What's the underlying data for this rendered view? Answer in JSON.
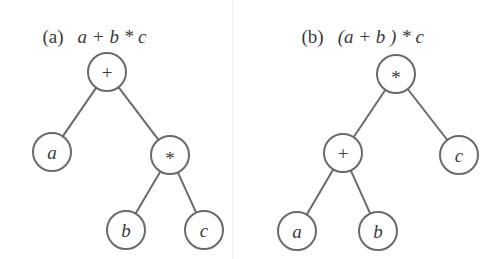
{
  "figure": {
    "panel_a": {
      "tag": "(a)",
      "expression": "a + b * c",
      "nodes": [
        {
          "id": "a_plus",
          "label": "+",
          "x": 107,
          "y": 72,
          "kind": "op"
        },
        {
          "id": "a_a",
          "label": "a",
          "x": 52,
          "y": 152,
          "kind": "var"
        },
        {
          "id": "a_mul",
          "label": "*",
          "x": 170,
          "y": 155,
          "kind": "op"
        },
        {
          "id": "a_b",
          "label": "b",
          "x": 126,
          "y": 230,
          "kind": "var"
        },
        {
          "id": "a_c",
          "label": "c",
          "x": 204,
          "y": 230,
          "kind": "var"
        }
      ],
      "edges": [
        [
          "a_plus",
          "a_a"
        ],
        [
          "a_plus",
          "a_mul"
        ],
        [
          "a_mul",
          "a_b"
        ],
        [
          "a_mul",
          "a_c"
        ]
      ]
    },
    "panel_b": {
      "tag": "(b)",
      "expression": "(a + b ) * c",
      "nodes": [
        {
          "id": "b_mul",
          "label": "*",
          "x": 396,
          "y": 74,
          "kind": "op"
        },
        {
          "id": "b_plus",
          "label": "+",
          "x": 343,
          "y": 153,
          "kind": "op"
        },
        {
          "id": "b_c",
          "label": "c",
          "x": 459,
          "y": 155,
          "kind": "var"
        },
        {
          "id": "b_a",
          "label": "a",
          "x": 297,
          "y": 231,
          "kind": "var"
        },
        {
          "id": "b_b",
          "label": "b",
          "x": 378,
          "y": 231,
          "kind": "var"
        }
      ],
      "edges": [
        [
          "b_mul",
          "b_plus"
        ],
        [
          "b_mul",
          "b_c"
        ],
        [
          "b_plus",
          "b_a"
        ],
        [
          "b_plus",
          "b_b"
        ]
      ]
    },
    "node_radius": 19,
    "colors": {
      "stroke": "#6a6a6a",
      "text": "#3a3a3a"
    }
  }
}
